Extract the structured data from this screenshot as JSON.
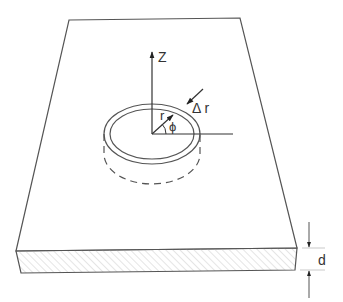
{
  "figure": {
    "type": "technical-diagram",
    "labels": {
      "z_axis": "Z",
      "radius": "r",
      "angle": "ϕ",
      "ring_width": "Δ r",
      "thickness": "d"
    },
    "colors": {
      "line": "#555555",
      "text": "#333333",
      "hatch": "#cccccc",
      "background": "#ffffff"
    }
  }
}
